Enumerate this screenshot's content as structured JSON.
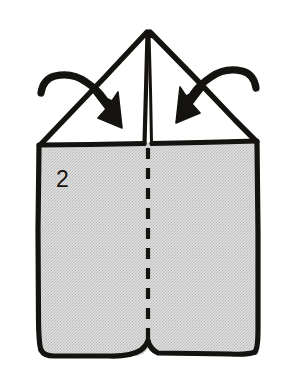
{
  "figure": {
    "kind": "origami-instruction-diagram",
    "step_number": "2",
    "background_color": "#ffffff",
    "ink_color": "#15130f",
    "paper_fill_color": "#d4d4d4",
    "flap_fill_color": "#ffffff",
    "canvas": {
      "width": 296,
      "height": 377
    }
  },
  "elements": {
    "paper_body": {
      "name": "folded-paper-body",
      "description": "Large gray rectangular body of the folded paper",
      "fill": "#d4d4d4"
    },
    "left_flap": {
      "name": "left-triangular-flap",
      "description": "White triangular flap on the left sloping down from the apex",
      "fill": "#ffffff"
    },
    "right_flap": {
      "name": "right-triangular-flap",
      "description": "White triangular flap on the right sloping down from the apex",
      "fill": "#ffffff"
    },
    "center_ridge": {
      "name": "center-ridge-line",
      "description": "Vertical double ridge line running from the apex to the horizontal edge"
    },
    "fold_line": {
      "name": "center-fold-dashed-line",
      "description": "Vertical dashed fold line running down the middle of the gray body",
      "style": "dashed"
    },
    "arrow_left": {
      "name": "fold-arrow-left",
      "description": "Curved arrow on the left pointing down and to the right, indicating fold direction"
    },
    "arrow_right": {
      "name": "fold-arrow-right",
      "description": "Curved arrow on the right pointing down and to the left, indicating fold direction"
    },
    "step_label": {
      "name": "step-number-label",
      "value": "2"
    }
  }
}
